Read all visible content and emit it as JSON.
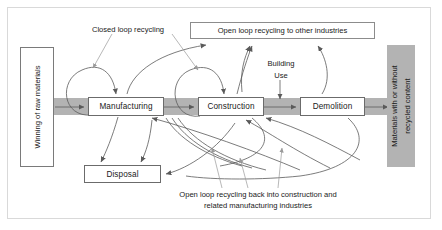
{
  "diagram": {
    "colors": {
      "band": "#b3b3b3",
      "box_fill": "#ffffff",
      "box_stroke": "#6b6b6b",
      "flow_arrow": "#5a5a5a",
      "leader_line": "#9a9a9a",
      "gray_panel": "#b3b3b3",
      "outer_border": "#d9d9d9",
      "text": "#1a1a1a"
    },
    "source_panel": {
      "label": "Winning of raw materials"
    },
    "sink_panel": {
      "line1": "Materials with or without",
      "line2": "recycled content"
    },
    "stages": [
      {
        "id": "manufacturing",
        "label": "Manufacturing"
      },
      {
        "id": "construction",
        "label": "Construction"
      },
      {
        "id": "demolition",
        "label": "Demolition"
      }
    ],
    "disposal": {
      "label": "Disposal"
    },
    "open_loop_box": {
      "label": "Open loop recycling to other industries"
    },
    "annotations": [
      {
        "id": "closed-loop",
        "label": "Closed loop recycling"
      },
      {
        "id": "building-use-line1",
        "label": "Building"
      },
      {
        "id": "building-use-line2",
        "label": "Use"
      }
    ],
    "bottom_caption": {
      "line1": "Open loop recycling back into construction and",
      "line2": "related manufacturing industries"
    }
  }
}
